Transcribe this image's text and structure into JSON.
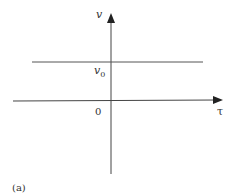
{
  "diagram": {
    "caption": "(a)",
    "axes": {
      "vertical_label": "v",
      "horizontal_label": "τ",
      "origin_label": "0"
    },
    "level_line": {
      "label_main": "v",
      "label_sub": "0"
    },
    "colors": {
      "line": "#444444",
      "text": "#333333",
      "background": "#ffffff"
    }
  }
}
